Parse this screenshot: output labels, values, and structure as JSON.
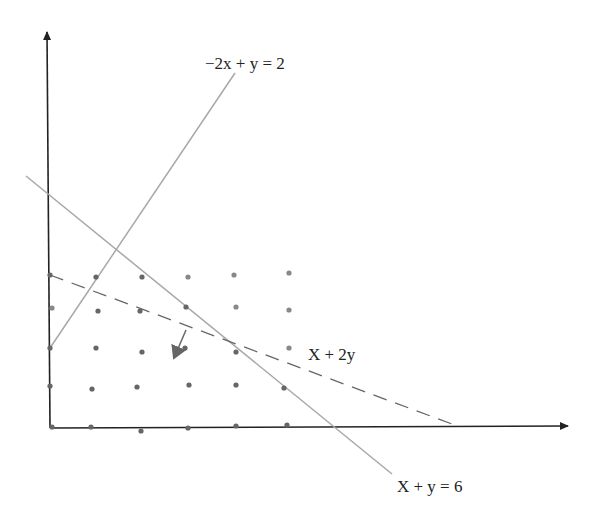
{
  "diagram": {
    "labels": {
      "constraint_1": "−2x + y = 2",
      "objective": "X + 2y",
      "constraint_2": "X + y = 6"
    },
    "colors": {
      "axis": "#222222",
      "constraint_line": "#a8a8a8",
      "objective_line": "#666666",
      "point": "#666666",
      "direction_arrow": "#666666"
    },
    "axes": {
      "origin_px": [
        50,
        428
      ],
      "x_end_px": [
        570,
        426
      ],
      "y_end_px": [
        47,
        30
      ]
    },
    "lines": [
      {
        "name": "constraint-neg2x-plus-y-eq-2",
        "x1": 50,
        "y1": 348,
        "x2": 235,
        "y2": 73,
        "style": "solid"
      },
      {
        "name": "constraint-x-plus-y-eq-6",
        "x1": 26,
        "y1": 176,
        "x2": 392,
        "y2": 474,
        "style": "solid"
      },
      {
        "name": "objective-x-plus-2y",
        "x1": 50,
        "y1": 275,
        "x2": 452,
        "y2": 424,
        "style": "dashed"
      }
    ],
    "direction_arrow": {
      "x1": 186,
      "y1": 330,
      "x2": 172,
      "y2": 362
    },
    "lattice_points": [
      [
        50,
        275
      ],
      [
        96,
        277
      ],
      [
        142,
        277
      ],
      [
        188,
        277
      ],
      [
        234,
        275
      ],
      [
        289,
        273
      ],
      [
        52,
        308
      ],
      [
        98,
        311
      ],
      [
        140,
        311
      ],
      [
        186,
        307
      ],
      [
        236,
        307
      ],
      [
        289,
        310
      ],
      [
        50,
        348
      ],
      [
        96,
        348
      ],
      [
        142,
        352
      ],
      [
        185,
        348
      ],
      [
        236,
        352
      ],
      [
        289,
        348
      ],
      [
        50,
        386
      ],
      [
        92,
        389
      ],
      [
        137,
        387
      ],
      [
        189,
        385
      ],
      [
        236,
        385
      ],
      [
        284,
        388
      ],
      [
        52,
        427
      ],
      [
        91,
        427
      ],
      [
        141,
        431
      ],
      [
        188,
        428
      ],
      [
        236,
        426
      ],
      [
        287,
        425
      ]
    ]
  }
}
